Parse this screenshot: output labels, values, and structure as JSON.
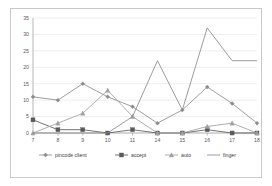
{
  "chart_data": {
    "type": "line",
    "title": "",
    "xlabel": "",
    "ylabel": "",
    "categories": [
      "7",
      "8",
      "9",
      "10",
      "11",
      "14",
      "15",
      "16",
      "17",
      "18"
    ],
    "ylim": [
      0,
      35
    ],
    "ytick_labels": [
      "0",
      "5",
      "10",
      "15",
      "20",
      "25",
      "30",
      "35"
    ],
    "ytick_values": [
      0,
      5,
      10,
      15,
      20,
      25,
      30,
      35
    ],
    "grid": true,
    "legend_position": "bottom",
    "series": [
      {
        "name": "pincode client",
        "marker": "diamond",
        "color": "#8c8c8c",
        "values": [
          11,
          10,
          15,
          11,
          8,
          3,
          7,
          14,
          9,
          3
        ]
      },
      {
        "name": "accept",
        "marker": "square",
        "color": "#5a5a5a",
        "values": [
          4,
          1,
          1,
          0,
          1,
          0,
          0,
          1,
          0,
          0
        ]
      },
      {
        "name": "auto",
        "marker": "triangle",
        "color": "#a0a0a0",
        "values": [
          0,
          3,
          6,
          13,
          5,
          0,
          0,
          2,
          3,
          0
        ]
      },
      {
        "name": "finger",
        "marker": "none",
        "color": "#8a8a8a",
        "values": [
          0,
          0,
          0,
          0,
          5,
          22,
          7,
          32,
          22,
          22
        ]
      }
    ]
  },
  "legend": {
    "items": [
      {
        "label": "pincode client",
        "marker": "diamond"
      },
      {
        "label": "accept",
        "marker": "square"
      },
      {
        "label": "auto",
        "marker": "triangle"
      },
      {
        "label": "finger",
        "marker": "none"
      }
    ]
  },
  "colors": {
    "grid": "#e0e0e0",
    "axis": "#9a9a9a",
    "border": "#c8c8c8",
    "text": "#595959",
    "background": "#ffffff"
  }
}
